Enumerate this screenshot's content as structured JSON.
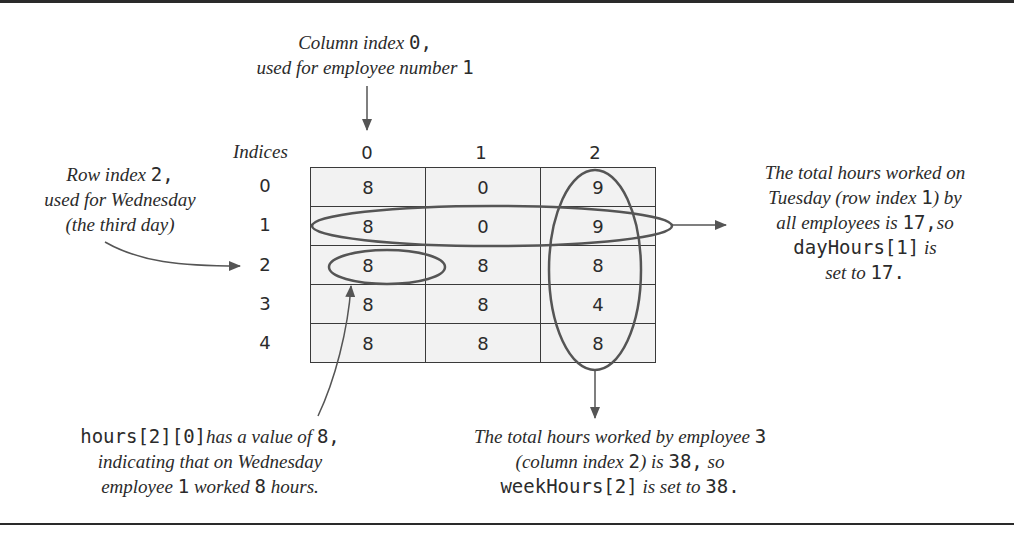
{
  "annotations": {
    "column_note": {
      "line1_text": "Column index ",
      "line1_code": "0",
      "line1_tail": ",",
      "line2_text": "used for employee number ",
      "line2_code": "1"
    },
    "row_note": {
      "line1_text": "Row index ",
      "line1_code": "2",
      "line1_tail": ",",
      "line2_text": "used for Wednesday",
      "line3_text": "(the third day)"
    },
    "day_total_note": {
      "line1_text": "The total hours worked on",
      "line2_text_a": "Tuesday (row index ",
      "line2_code": "1",
      "line2_text_b": ") by",
      "line3_text": "all employees is ",
      "line3_code": "17,",
      "line3_tail": "so",
      "line4_code": "dayHours[1]",
      "line4_text": " is",
      "line5_text": "set to ",
      "line5_code": "17."
    },
    "cell_note": {
      "line1_code": "hours[2][0]",
      "line1_text": "has a value of ",
      "line1_code2": "8,",
      "line2_text": "indicating that on Wednesday",
      "line3_text_a": "employee ",
      "line3_code": "1",
      "line3_text_b": " worked ",
      "line3_code2": "8",
      "line3_text_c": " hours."
    },
    "week_total_note": {
      "line1_text": "The total hours worked by employee ",
      "line1_code": "3",
      "line2_text_a": "(column index ",
      "line2_code": "2",
      "line2_text_b": ") is ",
      "line2_code2": "38,",
      "line2_text_c": " so",
      "line3_code": "weekHours[2]",
      "line3_text": " is set to ",
      "line3_code2": "38."
    }
  },
  "table": {
    "indices_label": "Indices",
    "column_indices": [
      "0",
      "1",
      "2"
    ],
    "row_indices": [
      "0",
      "1",
      "2",
      "3",
      "4"
    ],
    "rows": [
      [
        "8",
        "0",
        "9"
      ],
      [
        "8",
        "0",
        "9"
      ],
      [
        "8",
        "8",
        "8"
      ],
      [
        "8",
        "8",
        "4"
      ],
      [
        "8",
        "8",
        "8"
      ]
    ]
  },
  "colors": {
    "cell_fill": "#f2f2f2",
    "lines": "#3a3a3a",
    "highlight_stroke": "#555555"
  }
}
